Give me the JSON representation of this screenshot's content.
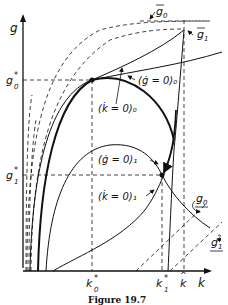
{
  "figure": {
    "caption": "Figure 19.7",
    "axes": {
      "x_label": "k",
      "y_label": "g"
    },
    "ticks": {
      "x": [
        "k0*",
        "k1*",
        "k^"
      ],
      "y": [
        "g0*",
        "g1*"
      ]
    },
    "curve_labels": {
      "gdot0": "(ġ = 0)₀",
      "kdot0": "(k̇ = 0)₀",
      "gdot1": "(ġ = 0)₁",
      "kdot1": "(k̇ = 0)₁",
      "gbar0": "ḡ₀",
      "gbar1": "ḡ₁",
      "gunder0": "g₀",
      "gunder1": "g₁"
    },
    "points": [
      {
        "name": "equilibrium-0",
        "k": "k0*",
        "g": "g0*"
      },
      {
        "name": "equilibrium-1",
        "k": "k1*",
        "g": "g1*"
      }
    ],
    "colors": {
      "ink": "#111111",
      "background": "#ffffff"
    }
  }
}
